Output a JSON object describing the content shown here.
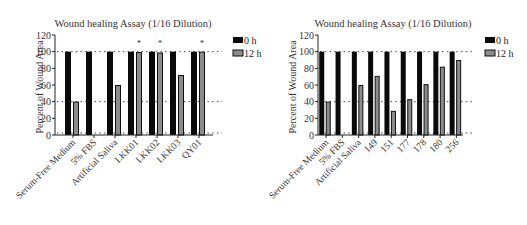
{
  "chart_data": [
    {
      "type": "bar",
      "title": "Wound healing Assay (1/16 Dilution)",
      "xlabel": "",
      "ylabel": "Percent of Wound Area",
      "ylim": [
        0,
        120
      ],
      "yticks": [
        0,
        20,
        40,
        60,
        80,
        100,
        120
      ],
      "grid": "dotted horizontal reference lines at 0, 40, 100",
      "legend_position": "right-top",
      "categories": [
        "Serum-Free Medium",
        "5% FBS",
        "Artificial Saliva",
        "LKK01",
        "LKK02",
        "LKK03",
        "QY01"
      ],
      "series": [
        {
          "name": "0 h",
          "color": "#0a0a0a",
          "values": [
            100,
            100,
            100,
            100,
            100,
            100,
            100
          ]
        },
        {
          "name": "12 h",
          "color": "#8c8c8c",
          "values": [
            40,
            0,
            60,
            99.5,
            99,
            72,
            100
          ]
        }
      ],
      "annotations": [
        {
          "category": "LKK01",
          "series": "12 h",
          "text": "*"
        },
        {
          "category": "LKK02",
          "series": "12 h",
          "text": "*"
        },
        {
          "category": "QY01",
          "series": "12 h",
          "text": "*"
        }
      ]
    },
    {
      "type": "bar",
      "title": "Wound healing Assay (1/16 Dilution)",
      "xlabel": "",
      "ylabel": "Percent of Wound Area",
      "ylim": [
        0,
        120
      ],
      "yticks": [
        0,
        20,
        40,
        60,
        80,
        100,
        120
      ],
      "grid": "dotted horizontal reference lines at 0, 40, 100",
      "legend_position": "right-top",
      "categories": [
        "Serum-Free Medium",
        "5% FBS",
        "Artificial Saliva",
        "149",
        "151",
        "177",
        "178",
        "180",
        "256"
      ],
      "series": [
        {
          "name": "0 h",
          "color": "#0a0a0a",
          "values": [
            100,
            100,
            100,
            100,
            100,
            100,
            100,
            100,
            100
          ]
        },
        {
          "name": "12 h",
          "color": "#8c8c8c",
          "values": [
            40,
            0,
            60,
            71,
            29,
            43,
            61,
            82,
            90
          ]
        }
      ],
      "annotations": []
    }
  ]
}
